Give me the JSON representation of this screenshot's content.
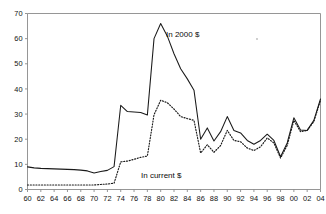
{
  "chart": {
    "title": "",
    "subtitle": "",
    "xlabel": "",
    "ylabel": ""
  },
  "labels": {
    "real_series": "In 2000 $",
    "nominal_series": "In current $"
  },
  "axis": {
    "y_ticks": [
      "0",
      "10",
      "20",
      "30",
      "40",
      "50",
      "60",
      "70"
    ],
    "x_ticks": [
      "60",
      "62",
      "64",
      "66",
      "68",
      "70",
      "72",
      "74",
      "76",
      "78",
      "80",
      "82",
      "84",
      "86",
      "88",
      "90",
      "92",
      "94",
      "96",
      "98",
      "00",
      "02",
      "04"
    ]
  },
  "colors": {
    "series_line": "#1a1a1a",
    "axis": "#8a8a8a",
    "text": "#111111",
    "background": "#ffffff"
  },
  "chart_data": {
    "type": "line",
    "title": "",
    "xlabel": "",
    "ylabel": "",
    "xlim": [
      1960,
      2004
    ],
    "ylim": [
      0,
      70
    ],
    "grid": false,
    "legend": "inline-annotations",
    "x": [
      1960,
      1961,
      1962,
      1963,
      1964,
      1965,
      1966,
      1967,
      1968,
      1969,
      1970,
      1971,
      1972,
      1973,
      1974,
      1975,
      1976,
      1977,
      1978,
      1979,
      1980,
      1981,
      1982,
      1983,
      1984,
      1985,
      1986,
      1987,
      1988,
      1989,
      1990,
      1991,
      1992,
      1993,
      1994,
      1995,
      1996,
      1997,
      1998,
      1999,
      2000,
      2001,
      2002,
      2003,
      2004
    ],
    "x_tick_labels": [
      "60",
      "62",
      "64",
      "66",
      "68",
      "70",
      "72",
      "74",
      "76",
      "78",
      "80",
      "82",
      "84",
      "86",
      "88",
      "90",
      "92",
      "94",
      "96",
      "98",
      "00",
      "02",
      "04"
    ],
    "series": [
      {
        "name": "In 2000 $",
        "style": "solid",
        "values": [
          9.0,
          8.6,
          8.4,
          8.3,
          8.2,
          8.1,
          8.0,
          7.9,
          7.7,
          7.4,
          6.6,
          7.2,
          7.6,
          9.1,
          33.5,
          31.0,
          30.8,
          30.6,
          29.6,
          60.0,
          66.0,
          61.0,
          54.0,
          48.0,
          44.0,
          39.5,
          20.0,
          24.5,
          19.3,
          23.0,
          29.0,
          23.5,
          22.5,
          19.5,
          18.0,
          19.5,
          22.0,
          19.5,
          13.0,
          18.5,
          28.5,
          23.7,
          23.5,
          27.5,
          36.0
        ]
      },
      {
        "name": "In current $",
        "style": "dotted",
        "values": [
          1.8,
          1.8,
          1.8,
          1.8,
          1.8,
          1.8,
          1.8,
          1.8,
          1.8,
          1.8,
          1.8,
          2.0,
          2.2,
          2.5,
          11.0,
          11.3,
          12.0,
          12.8,
          13.3,
          29.7,
          35.5,
          34.5,
          32.0,
          29.0,
          28.2,
          27.5,
          14.5,
          17.8,
          14.8,
          17.5,
          23.5,
          19.5,
          19.0,
          16.5,
          15.5,
          17.0,
          20.5,
          18.5,
          12.5,
          17.5,
          27.5,
          23.0,
          23.5,
          27.0,
          35.5
        ]
      }
    ]
  }
}
